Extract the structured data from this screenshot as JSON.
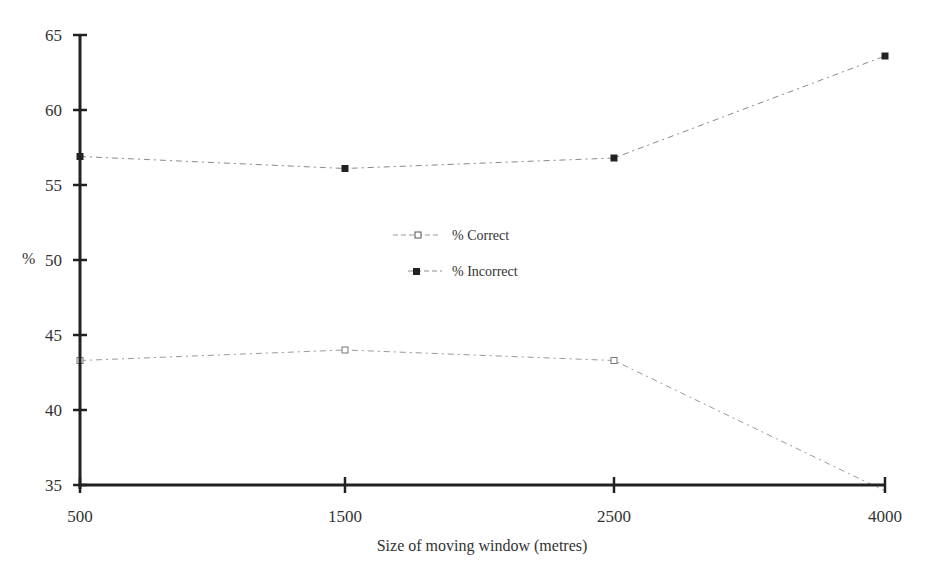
{
  "chart_data": {
    "type": "line",
    "title": "",
    "xlabel": "Size of moving window (metres)",
    "ylabel": "%",
    "categories": [
      "500",
      "1500",
      "2500",
      "4000"
    ],
    "x": [
      500,
      1500,
      2500,
      4000
    ],
    "ylim": [
      35,
      65
    ],
    "yticks": [
      35,
      40,
      45,
      50,
      55,
      60,
      65
    ],
    "grid": false,
    "legend_position": "center",
    "series": [
      {
        "name": "% Correct",
        "marker": "open-square",
        "values": [
          43.3,
          44.0,
          43.3,
          34.6
        ]
      },
      {
        "name": "% Incorrect",
        "marker": "filled-square",
        "values": [
          56.9,
          56.1,
          56.8,
          63.6
        ]
      }
    ]
  },
  "axes": {
    "x_title": "Size of moving window (metres)",
    "y_title": "%",
    "x_ticks": [
      "500",
      "1500",
      "2500",
      "4000"
    ],
    "y_ticks": [
      "35",
      "40",
      "45",
      "50",
      "55",
      "60",
      "65"
    ]
  },
  "legend": {
    "correct": "% Correct",
    "incorrect": "% Incorrect"
  },
  "colors": {
    "axis": "#222222",
    "correct_line": "#9a9a9a",
    "incorrect_line": "#8a8a8a",
    "marker_fill": "#222222"
  }
}
